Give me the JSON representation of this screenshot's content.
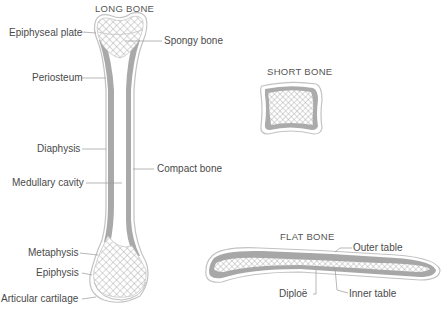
{
  "titles": {
    "long_bone": "LONG BONE",
    "short_bone": "SHORT BONE",
    "flat_bone": "FLAT BONE"
  },
  "labels": {
    "epiphyseal_plate": "Epiphyseal plate",
    "spongy_bone": "Spongy bone",
    "periosteum": "Periosteum",
    "diaphysis": "Diaphysis",
    "compact_bone": "Compact bone",
    "medullary_cavity": "Medullary cavity",
    "metaphysis": "Metaphysis",
    "epiphysis": "Epiphysis",
    "articular_cartilage": "Articular cartilage",
    "outer_table": "Outer table",
    "diploe": "Diploë",
    "inner_table": "Inner table"
  },
  "colors": {
    "compact": "#a8a8a8",
    "outline": "#bdbdbd",
    "spongy_mesh": "#b5b5b5",
    "leader": "#999999"
  }
}
